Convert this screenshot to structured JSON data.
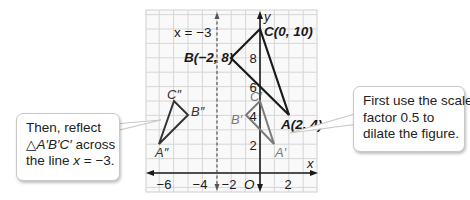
{
  "chart_data": {
    "type": "scatter",
    "title": "",
    "xlabel": "x",
    "ylabel": "y",
    "xlim": [
      -7.9,
      4
    ],
    "ylim": [
      -1.3,
      11.3
    ],
    "grid": true,
    "x_tick_labels": [
      "-6",
      "-4",
      "-2",
      "2"
    ],
    "y_tick_labels": [
      "2",
      "4",
      "6",
      "8"
    ],
    "origin_label": "O",
    "reflection_line": {
      "equation_label": "x = −3",
      "x": -3,
      "style": "dashed"
    },
    "series": [
      {
        "name": "Triangle ABC (original)",
        "color": "#1a1a1a",
        "points": [
          {
            "label": "A(2, 4)",
            "x": 2,
            "y": 4
          },
          {
            "label": "B(−2, 8)",
            "x": -2,
            "y": 8
          },
          {
            "label": "C(0, 10)",
            "x": 0,
            "y": 10
          }
        ]
      },
      {
        "name": "Triangle A'B'C' (dilated by 0.5)",
        "color": "#7a7a7a",
        "points": [
          {
            "label": "A′",
            "x": 1,
            "y": 2
          },
          {
            "label": "B′",
            "x": -1,
            "y": 4
          },
          {
            "label": "C′",
            "x": 0,
            "y": 5
          }
        ]
      },
      {
        "name": "Triangle A''B''C'' (reflected across x = -3)",
        "color": "#333333",
        "points": [
          {
            "label": "A″",
            "x": -7,
            "y": 2
          },
          {
            "label": "B″",
            "x": -5,
            "y": 4
          },
          {
            "label": "C″",
            "x": -6,
            "y": 5
          }
        ]
      }
    ],
    "annotations": [
      "Then, reflect △A′B′C′ across the line x = −3.",
      "First use the scale factor 0.5 to dilate the figure."
    ]
  },
  "labels": {
    "x_axis": "x",
    "y_axis": "y",
    "origin": "O",
    "reflect_line": "x = −3",
    "A": "A(2, 4)",
    "B": "B(−2, 8)",
    "C": "C(0, 10)",
    "A1": "A′",
    "B1": "B′",
    "C1": "C′",
    "A2": "A″",
    "B2": "B″",
    "C2": "C″",
    "xt_m6": "−6",
    "xt_m4": "−4",
    "xt_m2": "−2",
    "xt_2": "2",
    "yt_2": "2",
    "yt_4": "4",
    "yt_6": "6",
    "yt_8": "8"
  },
  "callouts": {
    "left": {
      "line1": "Then, reflect",
      "line2_tri": "△",
      "line2_name": "A′B′C′",
      "line2_rest": " across",
      "line3_pre": "the line ",
      "line3_var": "x",
      "line3_post": " = −3."
    },
    "right": {
      "line1": "First use the scale",
      "line2": "factor 0.5 to",
      "line3": "dilate the figure."
    }
  },
  "colors": {
    "grid": "#d4d4d4",
    "grid_bg": "#f7f7f7",
    "axis": "#1a1a1a",
    "original": "#1a1a1a",
    "dilated": "#7a7a7a",
    "reflected": "#333333",
    "dashed_line": "#555555"
  }
}
